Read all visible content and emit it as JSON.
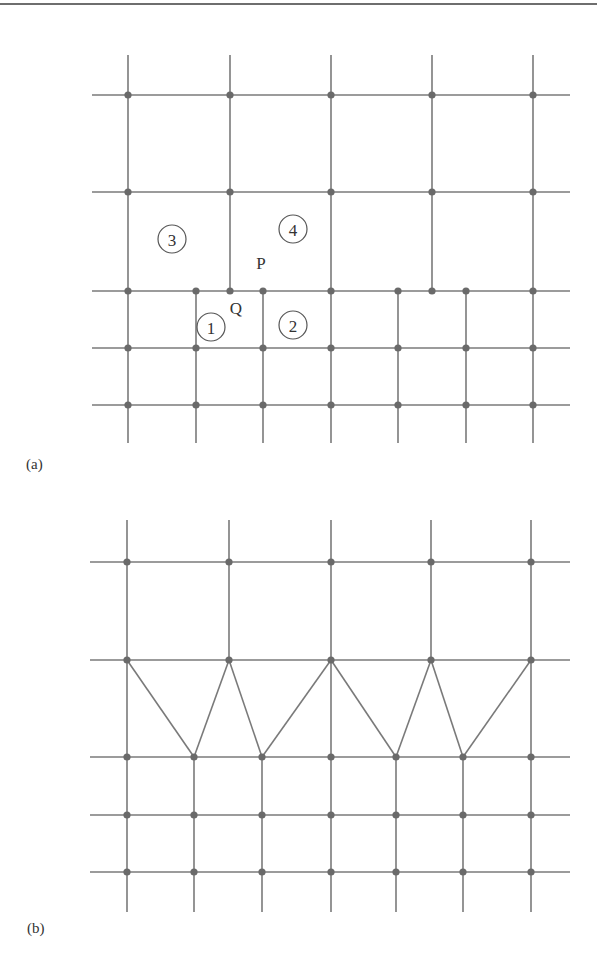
{
  "figure": {
    "style": {
      "line_color": "#7a7a7a",
      "node_color": "#6a6a6a",
      "background": "#ffffff"
    },
    "panel_a": {
      "label": "(a)",
      "vertical_lines": [
        {
          "x": 128,
          "y1": 55,
          "y2": 443
        },
        {
          "x": 230,
          "y1": 55,
          "y2": 291
        },
        {
          "x": 331,
          "y1": 55,
          "y2": 443
        },
        {
          "x": 432,
          "y1": 55,
          "y2": 291
        },
        {
          "x": 533,
          "y1": 55,
          "y2": 443
        },
        {
          "x": 196,
          "y1": 291,
          "y2": 443
        },
        {
          "x": 263,
          "y1": 291,
          "y2": 443
        },
        {
          "x": 398,
          "y1": 291,
          "y2": 443
        },
        {
          "x": 466,
          "y1": 291,
          "y2": 443
        }
      ],
      "horizontal_lines": [
        {
          "y": 95,
          "x1": 92,
          "x2": 570
        },
        {
          "y": 192,
          "x1": 92,
          "x2": 570
        },
        {
          "y": 291,
          "x1": 92,
          "x2": 570
        },
        {
          "y": 348,
          "x1": 92,
          "x2": 570
        },
        {
          "y": 405,
          "x1": 92,
          "x2": 570
        }
      ],
      "nodes": [
        [
          128,
          95
        ],
        [
          230,
          95
        ],
        [
          331,
          95
        ],
        [
          432,
          95
        ],
        [
          533,
          95
        ],
        [
          128,
          192
        ],
        [
          230,
          192
        ],
        [
          331,
          192
        ],
        [
          432,
          192
        ],
        [
          533,
          192
        ],
        [
          128,
          291
        ],
        [
          196,
          291
        ],
        [
          230,
          291
        ],
        [
          263,
          291
        ],
        [
          331,
          291
        ],
        [
          398,
          291
        ],
        [
          432,
          291
        ],
        [
          466,
          291
        ],
        [
          533,
          291
        ],
        [
          128,
          348
        ],
        [
          196,
          348
        ],
        [
          263,
          348
        ],
        [
          331,
          348
        ],
        [
          398,
          348
        ],
        [
          466,
          348
        ],
        [
          533,
          348
        ],
        [
          128,
          405
        ],
        [
          196,
          405
        ],
        [
          263,
          405
        ],
        [
          331,
          405
        ],
        [
          398,
          405
        ],
        [
          466,
          405
        ],
        [
          533,
          405
        ]
      ],
      "cell_labels": [
        {
          "text": "1",
          "x": 211,
          "y": 327
        },
        {
          "text": "2",
          "x": 293,
          "y": 325
        },
        {
          "text": "3",
          "x": 172,
          "y": 239
        },
        {
          "text": "4",
          "x": 293,
          "y": 229
        }
      ],
      "point_labels": [
        {
          "text": "P",
          "x": 261,
          "y": 263
        },
        {
          "text": "Q",
          "x": 236,
          "y": 308
        }
      ]
    },
    "panel_b": {
      "label": "(b)",
      "vertical_lines": [
        {
          "x": 127,
          "y1": 520,
          "y2": 912
        },
        {
          "x": 229,
          "y1": 520,
          "y2": 660
        },
        {
          "x": 331,
          "y1": 520,
          "y2": 912
        },
        {
          "x": 431,
          "y1": 520,
          "y2": 660
        },
        {
          "x": 531,
          "y1": 520,
          "y2": 912
        },
        {
          "x": 194,
          "y1": 757,
          "y2": 912
        },
        {
          "x": 262,
          "y1": 757,
          "y2": 912
        },
        {
          "x": 396,
          "y1": 757,
          "y2": 912
        },
        {
          "x": 463,
          "y1": 757,
          "y2": 912
        }
      ],
      "horizontal_lines": [
        {
          "y": 562,
          "x1": 90,
          "x2": 570
        },
        {
          "y": 660,
          "x1": 90,
          "x2": 570
        },
        {
          "y": 757,
          "x1": 90,
          "x2": 570
        },
        {
          "y": 815,
          "x1": 90,
          "x2": 570
        },
        {
          "y": 872,
          "x1": 90,
          "x2": 570
        }
      ],
      "diagonals": [
        {
          "x1": 127,
          "y1": 660,
          "x2": 194,
          "y2": 757
        },
        {
          "x1": 229,
          "y1": 660,
          "x2": 194,
          "y2": 757
        },
        {
          "x1": 229,
          "y1": 660,
          "x2": 262,
          "y2": 757
        },
        {
          "x1": 331,
          "y1": 660,
          "x2": 262,
          "y2": 757
        },
        {
          "x1": 331,
          "y1": 660,
          "x2": 396,
          "y2": 757
        },
        {
          "x1": 431,
          "y1": 660,
          "x2": 396,
          "y2": 757
        },
        {
          "x1": 431,
          "y1": 660,
          "x2": 463,
          "y2": 757
        },
        {
          "x1": 531,
          "y1": 660,
          "x2": 463,
          "y2": 757
        }
      ],
      "nodes": [
        [
          127,
          562
        ],
        [
          229,
          562
        ],
        [
          331,
          562
        ],
        [
          431,
          562
        ],
        [
          531,
          562
        ],
        [
          127,
          660
        ],
        [
          229,
          660
        ],
        [
          331,
          660
        ],
        [
          431,
          660
        ],
        [
          531,
          660
        ],
        [
          127,
          757
        ],
        [
          194,
          757
        ],
        [
          262,
          757
        ],
        [
          331,
          757
        ],
        [
          396,
          757
        ],
        [
          463,
          757
        ],
        [
          531,
          757
        ],
        [
          127,
          815
        ],
        [
          194,
          815
        ],
        [
          262,
          815
        ],
        [
          331,
          815
        ],
        [
          396,
          815
        ],
        [
          463,
          815
        ],
        [
          531,
          815
        ],
        [
          127,
          872
        ],
        [
          194,
          872
        ],
        [
          262,
          872
        ],
        [
          331,
          872
        ],
        [
          396,
          872
        ],
        [
          463,
          872
        ],
        [
          531,
          872
        ]
      ]
    }
  }
}
